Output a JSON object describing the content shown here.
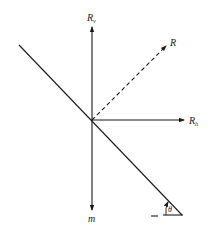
{
  "diagram": {
    "labels": {
      "rv": "R",
      "rv_sub": "v",
      "r": "R",
      "rh": "R",
      "rh_sub": "h",
      "m": "m",
      "theta": "θ",
      "dash": "—"
    },
    "colors": {
      "line": "#1a1a1a",
      "background": "#ffffff"
    }
  }
}
